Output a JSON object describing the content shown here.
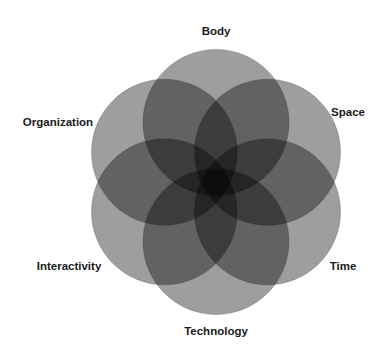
{
  "diagram": {
    "type": "six-set overlapping circles (venn-style flower)",
    "center": {
      "x": 216,
      "y": 182
    },
    "ring_radius": 59.5,
    "circle_radius": 73,
    "fill_color": "#000000",
    "fill_opacity": 0.38,
    "stroke_color": "#3a3a3a",
    "circles": [
      {
        "id": "body",
        "label": "Body",
        "angle_deg": -90,
        "label_x": 216,
        "label_y": 31
      },
      {
        "id": "space",
        "label": "Space",
        "angle_deg": -30,
        "label_x": 348,
        "label_y": 112
      },
      {
        "id": "time",
        "label": "Time",
        "angle_deg": 30,
        "label_x": 343,
        "label_y": 266
      },
      {
        "id": "technology",
        "label": "Technology",
        "angle_deg": 90,
        "label_x": 216,
        "label_y": 331
      },
      {
        "id": "interactivity",
        "label": "Interactivity",
        "angle_deg": 150,
        "label_x": 69,
        "label_y": 266
      },
      {
        "id": "organization",
        "label": "Organization",
        "angle_deg": 210,
        "label_x": 58,
        "label_y": 122
      }
    ]
  }
}
